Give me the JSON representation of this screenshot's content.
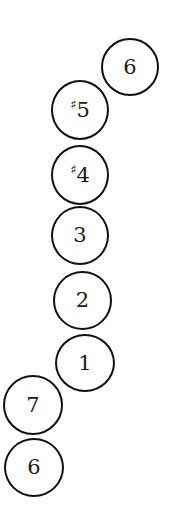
{
  "diagram": {
    "type": "scale-degree-sequence",
    "stroke_color": "#111111",
    "background": "#ffffff",
    "notes": [
      {
        "label": "6",
        "accidental": "",
        "degree": "6",
        "cx": 129,
        "cy": 66
      },
      {
        "label": "♯5",
        "accidental": "♯",
        "degree": "5",
        "cx": 80,
        "cy": 110
      },
      {
        "label": "♯4",
        "accidental": "♯",
        "degree": "4",
        "cx": 80,
        "cy": 175
      },
      {
        "label": "3",
        "accidental": "",
        "degree": "3",
        "cx": 80,
        "cy": 236
      },
      {
        "label": "2",
        "accidental": "",
        "degree": "2",
        "cx": 82,
        "cy": 300
      },
      {
        "label": "1",
        "accidental": "",
        "degree": "1",
        "cx": 85,
        "cy": 363
      },
      {
        "label": "7",
        "accidental": "",
        "degree": "7",
        "cx": 34,
        "cy": 405
      },
      {
        "label": "6",
        "accidental": "",
        "degree": "6",
        "cx": 34,
        "cy": 467
      }
    ]
  }
}
